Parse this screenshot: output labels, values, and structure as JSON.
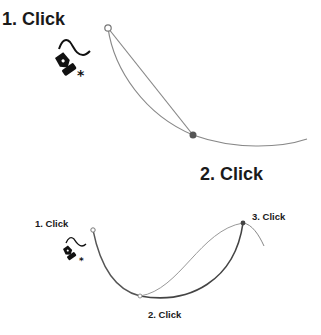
{
  "diagrams": [
    {
      "name": "two-click-curve",
      "labels": {
        "first": "1. Click",
        "second": "2. Click"
      },
      "colors": {
        "line": "#777777",
        "anchor_filled": "#555555",
        "anchor_open_stroke": "#777777",
        "text": "#1a1a1a"
      }
    },
    {
      "name": "three-click-curve",
      "labels": {
        "first": "1. Click",
        "second": "2. Click",
        "third": "3. Click"
      },
      "colors": {
        "line_light": "#8a8a8a",
        "line_dark": "#4a4a4a",
        "anchor_filled": "#444444",
        "text": "#1a1a1a"
      }
    }
  ],
  "icons": {
    "tool": "freeform-pen-tool-icon",
    "modifier": "asterisk-icon"
  }
}
